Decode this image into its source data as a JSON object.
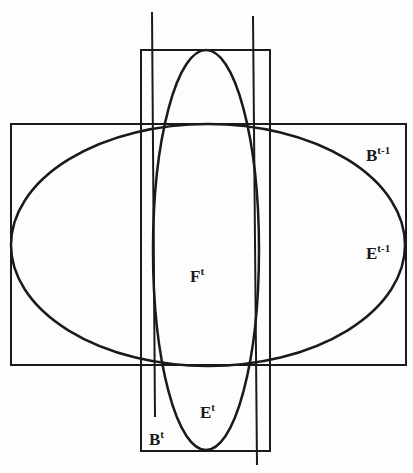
{
  "diagram": {
    "type": "geometric-figure",
    "stroke_color": "#1a1a1a",
    "background": "#fdfdfd",
    "shapes": {
      "bounding_box_prev": {
        "label": "B",
        "superscript": "t-1",
        "x": 11,
        "y": 124,
        "width": 395,
        "height": 241
      },
      "ellipse_prev": {
        "label": "E",
        "superscript": "t-1",
        "cx": 208,
        "cy": 245,
        "rx": 197,
        "ry": 121
      },
      "bounding_box_curr": {
        "label": "B",
        "superscript": "t",
        "x": 141,
        "y": 50,
        "width": 129,
        "height": 401
      },
      "ellipse_curr": {
        "label": "E",
        "superscript": "t",
        "cx": 206,
        "cy": 250,
        "rx": 53,
        "ry": 200
      },
      "line_left": {
        "x1": 152,
        "y1": 12,
        "x2": 155,
        "y2": 417
      },
      "line_right": {
        "x1": 253,
        "y1": 16,
        "x2": 257,
        "y2": 465
      }
    },
    "labels": {
      "b_prev": {
        "main": "B",
        "sup": "t-1"
      },
      "e_prev": {
        "main": "E",
        "sup": "t-1"
      },
      "f_curr": {
        "main": "F",
        "sup": "t"
      },
      "e_curr": {
        "main": "E",
        "sup": "t"
      },
      "b_curr": {
        "main": "B",
        "sup": "t"
      }
    }
  }
}
